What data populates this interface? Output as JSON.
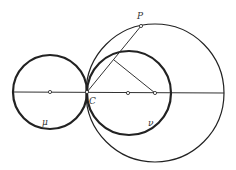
{
  "diagram": {
    "type": "geometry",
    "colors": {
      "stroke": "#222222",
      "background": "#ffffff"
    },
    "axis_line": {
      "x1": 14,
      "y1": 92,
      "x2": 224,
      "y2": 93
    },
    "circles": [
      {
        "id": "mu",
        "label": "μ",
        "cx": 50,
        "cy": 92,
        "r": 37,
        "stroke_width": 2.2,
        "label_x": 42,
        "label_y": 125
      },
      {
        "id": "nu",
        "label": "ν",
        "cx": 129,
        "cy": 93,
        "r": 42,
        "stroke_width": 2.2,
        "label_x": 148,
        "label_y": 126
      },
      {
        "id": "big",
        "label": "",
        "cx": 155,
        "cy": 93,
        "r": 69,
        "stroke_width": 1.2
      }
    ],
    "points": [
      {
        "id": "C",
        "label": "C",
        "x": 87,
        "y": 92,
        "label_x": 89,
        "label_y": 104
      },
      {
        "id": "P",
        "label": "P",
        "x": 141,
        "y": 26,
        "label_x": 137,
        "label_y": 19
      },
      {
        "id": "mu-center",
        "label": "",
        "x": 50,
        "y": 92
      },
      {
        "id": "nu-center",
        "label": "",
        "x": 128,
        "y": 93
      },
      {
        "id": "big-center",
        "label": "",
        "x": 155,
        "y": 93
      }
    ],
    "segments": [
      {
        "id": "CP",
        "x1": 87,
        "y1": 92,
        "x2": 141,
        "y2": 26
      },
      {
        "id": "perpendicular",
        "x1": 114,
        "y1": 60,
        "x2": 155,
        "y2": 93
      }
    ],
    "labels": {
      "P": "P",
      "C": "C",
      "mu": "μ",
      "nu": "ν"
    }
  }
}
